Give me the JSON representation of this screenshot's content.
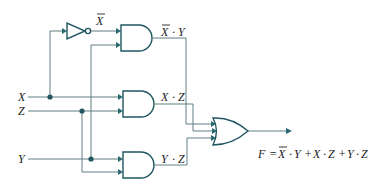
{
  "diagram": {
    "type": "logic-circuit",
    "inputs": [
      {
        "name": "X"
      },
      {
        "name": "Z"
      },
      {
        "name": "Y"
      }
    ],
    "inverter": {
      "input": "X",
      "output_label": "X",
      "output_overbar": true
    },
    "gates": [
      {
        "id": "and1",
        "type": "AND",
        "inputs": [
          "X̄",
          "Y"
        ],
        "output_label_a": "X",
        "output_label_dot": "·",
        "output_label_b": "Y",
        "overbar_a": true
      },
      {
        "id": "and2",
        "type": "AND",
        "inputs": [
          "X",
          "Z"
        ],
        "output_label_a": "X",
        "output_label_dot": "·",
        "output_label_b": "Z",
        "overbar_a": false
      },
      {
        "id": "and3",
        "type": "AND",
        "inputs": [
          "Y",
          "Z"
        ],
        "output_label_a": "Y",
        "output_label_dot": "·",
        "output_label_b": "Z",
        "overbar_a": false
      },
      {
        "id": "or1",
        "type": "OR",
        "inputs": [
          "X̄·Y",
          "X·Z",
          "Y·Z"
        ]
      }
    ],
    "output": {
      "lhs": "F",
      "eq": "=",
      "t1a": "X",
      "t1dot": "·",
      "t1b": "Y",
      "plus1": "+",
      "t2a": "X",
      "t2dot": "·",
      "t2b": "Z",
      "plus2": "+",
      "t3a": "Y",
      "t3dot": "·",
      "t3b": "Z"
    },
    "colors": {
      "wire": "#5f7f84",
      "gate": "#1f5660",
      "arrow": "#2b6a73",
      "text": "#222222"
    }
  }
}
